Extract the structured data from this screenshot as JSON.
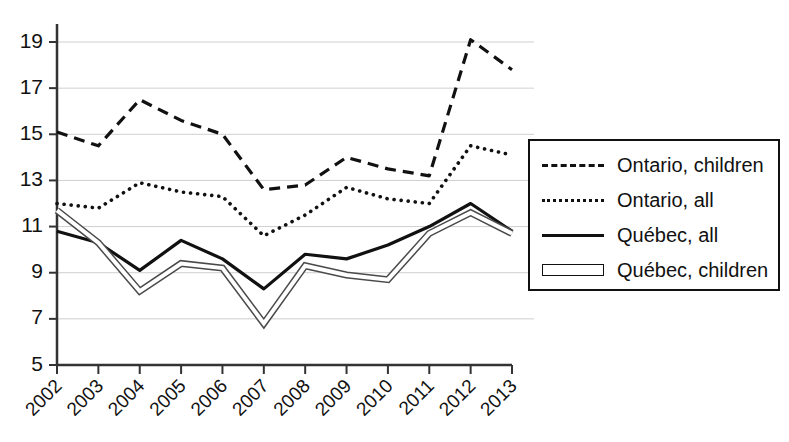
{
  "chart_data": {
    "type": "line",
    "title": "",
    "xlabel": "",
    "ylabel": "",
    "categories": [
      "2002",
      "2003",
      "2004",
      "2005",
      "2006",
      "2007",
      "2008",
      "2009",
      "2010",
      "2011",
      "2012",
      "2013"
    ],
    "ylim": [
      5,
      19
    ],
    "yticks": [
      5,
      7,
      9,
      11,
      13,
      15,
      17,
      19
    ],
    "grid": true,
    "legend_position": "right",
    "series": [
      {
        "name": "Ontario, children",
        "style": "dashed",
        "color": "#111111",
        "values": [
          15.1,
          14.5,
          16.5,
          15.6,
          15.0,
          12.6,
          12.8,
          14.0,
          13.5,
          13.2,
          19.1,
          17.8
        ]
      },
      {
        "name": "Ontario, all",
        "style": "dotted",
        "color": "#111111",
        "values": [
          12.0,
          11.8,
          12.9,
          12.5,
          12.3,
          10.6,
          11.5,
          12.7,
          12.2,
          12.0,
          14.5,
          14.1
        ]
      },
      {
        "name": "Québec, all",
        "style": "solid",
        "color": "#111111",
        "values": [
          10.8,
          10.3,
          9.1,
          10.4,
          9.6,
          8.3,
          9.8,
          9.6,
          10.2,
          11.0,
          12.0,
          10.8
        ]
      },
      {
        "name": "Québec, children",
        "style": "double",
        "color": "#666666",
        "values": [
          11.7,
          10.3,
          8.2,
          9.4,
          9.2,
          6.8,
          9.3,
          8.9,
          8.7,
          10.7,
          11.6,
          10.7
        ]
      }
    ]
  },
  "legend": {
    "items": [
      {
        "label": "Ontario, children",
        "swatch": "dashed"
      },
      {
        "label": "Ontario, all",
        "swatch": "dotted"
      },
      {
        "label": "Québec, all",
        "swatch": "solid"
      },
      {
        "label": "Québec, children",
        "swatch": "double"
      }
    ]
  },
  "axes": {
    "y_tick_labels": [
      "19",
      "17",
      "15",
      "13",
      "11",
      "9",
      "7",
      "5"
    ],
    "x_tick_labels": [
      "2002",
      "2003",
      "2004",
      "2005",
      "2006",
      "2007",
      "2008",
      "2009",
      "2010",
      "2011",
      "2012",
      "2013"
    ]
  }
}
